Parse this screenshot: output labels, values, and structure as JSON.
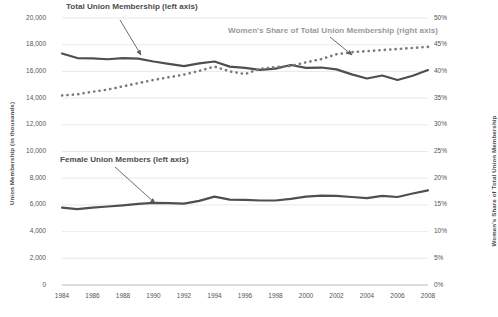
{
  "chart_data": {
    "type": "line",
    "title": "",
    "xlabel": "",
    "ylabel": "Union Membership (in thousands)",
    "y2label": "Women's Share of Total Union Membership",
    "x": [
      1984,
      1985,
      1986,
      1987,
      1988,
      1989,
      1990,
      1991,
      1992,
      1993,
      1994,
      1995,
      1996,
      1997,
      1998,
      1999,
      2000,
      2001,
      2002,
      2003,
      2004,
      2005,
      2006,
      2007,
      2008
    ],
    "xlim": [
      1984,
      2008
    ],
    "ylim": [
      0,
      20000
    ],
    "y2lim": [
      0,
      0.5
    ],
    "grid": true,
    "legend_position": "inline-annotations",
    "xticks": [
      "1984",
      "1986",
      "1988",
      "1990",
      "1992",
      "1994",
      "1996",
      "1998",
      "2000",
      "2002",
      "2004",
      "2006",
      "2008"
    ],
    "yticks": [
      "0",
      "2,000",
      "4,000",
      "6,000",
      "8,000",
      "10,000",
      "12,000",
      "14,000",
      "16,000",
      "18,000",
      "20,000"
    ],
    "y2ticks": [
      "0%",
      "5%",
      "10%",
      "15%",
      "20%",
      "25%",
      "30%",
      "35%",
      "40%",
      "45%",
      "50%"
    ],
    "series": [
      {
        "name": "Total Union Membership (left axis)",
        "axis": "left",
        "style": "solid",
        "color": "#4f4f4f",
        "values": [
          17340,
          17000,
          16970,
          16910,
          17000,
          16960,
          16740,
          16570,
          16390,
          16600,
          16740,
          16360,
          16270,
          16110,
          16210,
          16480,
          16260,
          16290,
          16150,
          15780,
          15470,
          15690,
          15360,
          15670,
          16100
        ]
      },
      {
        "name": "Female Union Members (left axis)",
        "axis": "left",
        "style": "solid",
        "color": "#4f4f4f",
        "values": [
          5800,
          5680,
          5800,
          5880,
          5970,
          6080,
          6150,
          6130,
          6090,
          6300,
          6620,
          6400,
          6370,
          6330,
          6330,
          6450,
          6620,
          6700,
          6680,
          6590,
          6510,
          6680,
          6590,
          6850,
          7090
        ]
      },
      {
        "name": "Women's Share of Total Union Membership (right axis)",
        "axis": "right",
        "style": "dotted",
        "color": "#7a7a7a",
        "values": [
          0.355,
          0.357,
          0.362,
          0.366,
          0.372,
          0.378,
          0.384,
          0.389,
          0.394,
          0.401,
          0.409,
          0.4,
          0.395,
          0.405,
          0.408,
          0.41,
          0.417,
          0.423,
          0.432,
          0.436,
          0.438,
          0.44,
          0.442,
          0.444,
          0.446
        ]
      }
    ],
    "annotations": [
      {
        "name": "total-union-membership-annotation",
        "text": "Total Union Membership (left axis)",
        "style": "dark"
      },
      {
        "name": "womens-share-annotation",
        "text": "Women's Share of Total Union Membership (right axis)",
        "style": "light"
      },
      {
        "name": "female-union-members-annotation",
        "text": "Female Union Members (left axis)",
        "style": "dark"
      }
    ]
  },
  "axes": {
    "left_title": "Union Membership (in thousands)",
    "right_title": "Women's Share of Total Union Membership"
  }
}
